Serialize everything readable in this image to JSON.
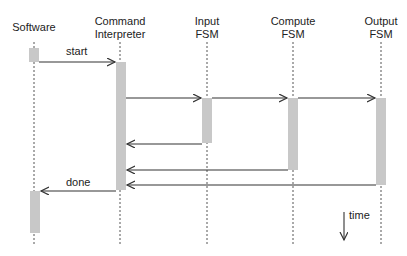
{
  "diagram": {
    "type": "sequence-diagram",
    "participants": [
      {
        "id": "software",
        "label_line1": "Software",
        "label_line2": "",
        "x": 34
      },
      {
        "id": "command-interpreter",
        "label_line1": "Command",
        "label_line2": "Interpreter",
        "x": 120
      },
      {
        "id": "input-fsm",
        "label_line1": "Input",
        "label_line2": "FSM",
        "x": 207
      },
      {
        "id": "compute-fsm",
        "label_line1": "Compute",
        "label_line2": "FSM",
        "x": 293
      },
      {
        "id": "output-fsm",
        "label_line1": "Output",
        "label_line2": "FSM",
        "x": 381
      }
    ],
    "messages": [
      {
        "from": "software",
        "to": "command-interpreter",
        "label": "start"
      },
      {
        "from": "command-interpreter",
        "to": "input-fsm",
        "label": ""
      },
      {
        "from": "command-interpreter",
        "to": "compute-fsm",
        "label": ""
      },
      {
        "from": "command-interpreter",
        "to": "output-fsm",
        "label": ""
      },
      {
        "from": "input-fsm",
        "to": "command-interpreter",
        "label": ""
      },
      {
        "from": "compute-fsm",
        "to": "command-interpreter",
        "label": ""
      },
      {
        "from": "output-fsm",
        "to": "command-interpreter",
        "label": ""
      },
      {
        "from": "command-interpreter",
        "to": "software",
        "label": "done"
      }
    ],
    "time_label": "time",
    "colors": {
      "activation": "#c8c8c8",
      "line": "#333333",
      "text": "#222222"
    }
  }
}
